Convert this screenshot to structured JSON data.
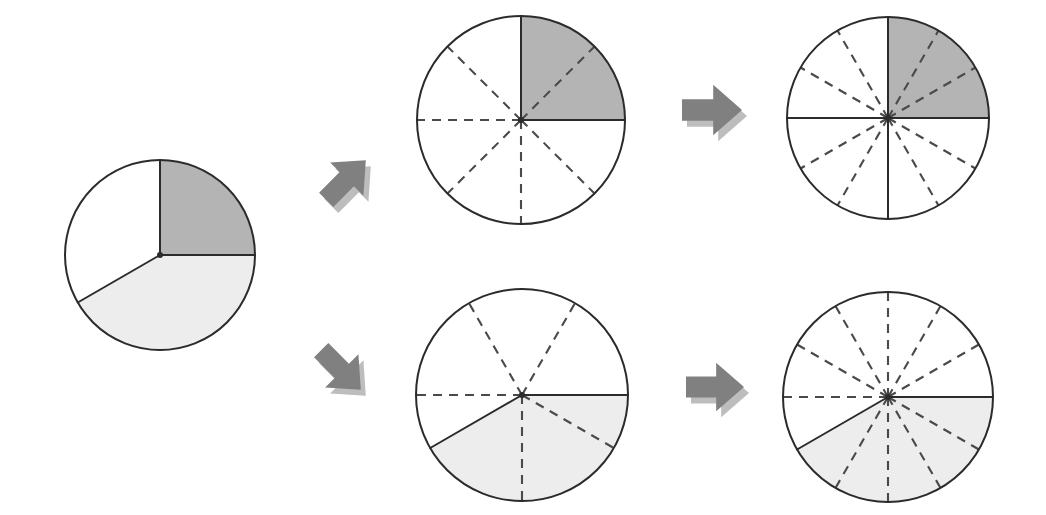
{
  "figure": {
    "background_color": "#ffffff",
    "stroke_color": "#2b2b2b",
    "dash_color": "#4a4a4a",
    "arrow_fill": "#808080",
    "arrow_shadow": "#bdbdbd",
    "shade_dark": "#b4b4b4",
    "shade_light": "#ededed",
    "shade_white": "#ffffff"
  },
  "chart_data": [
    {
      "type": "pie",
      "name": "source-pie-thirds",
      "label": "1 whole divided into thirds",
      "center": [
        160,
        255
      ],
      "radius": 95,
      "divisions": 3,
      "categories": [
        "dark-third",
        "light-third",
        "white-third"
      ],
      "values": [
        1,
        1,
        1
      ],
      "fractions": [
        "1/3",
        "1/3",
        "1/3"
      ],
      "colors": [
        "#b4b4b4",
        "#ededed",
        "#ffffff"
      ],
      "sector_bounds_deg": [
        [
          0,
          90
        ],
        [
          210,
          360
        ],
        [
          90,
          210
        ]
      ],
      "solid_radii_deg": [
        0,
        90,
        210
      ],
      "dashed_radii_deg": []
    },
    {
      "type": "pie",
      "name": "top-pie-eighths",
      "label": "thirds re-partitioned into eighths, 2/8 shaded dark",
      "center": [
        521,
        120
      ],
      "radius": 104,
      "divisions": 8,
      "categories": [
        "shaded",
        "unshaded"
      ],
      "values": [
        2,
        6
      ],
      "fractions": [
        "2/8",
        "6/8"
      ],
      "colors": [
        "#b4b4b4",
        "#ffffff"
      ],
      "sector_bounds_deg": [
        [
          0,
          90
        ],
        [
          90,
          360
        ]
      ],
      "solid_radii_deg": [
        0,
        90
      ],
      "dashed_radii_deg": [
        45,
        135,
        180,
        225,
        270,
        315
      ]
    },
    {
      "type": "pie",
      "name": "top-pie-twelfths",
      "label": "twelfths, 3/12 shaded dark",
      "center": [
        888,
        118
      ],
      "radius": 101,
      "divisions": 12,
      "categories": [
        "shaded",
        "unshaded"
      ],
      "values": [
        3,
        9
      ],
      "fractions": [
        "3/12",
        "9/12"
      ],
      "colors": [
        "#b4b4b4",
        "#ffffff"
      ],
      "sector_bounds_deg": [
        [
          0,
          90
        ],
        [
          90,
          360
        ]
      ],
      "solid_radii_deg": [
        0,
        90,
        180,
        270
      ],
      "dashed_radii_deg": [
        30,
        60,
        120,
        150,
        210,
        240,
        300,
        330
      ]
    },
    {
      "type": "pie",
      "name": "bottom-pie-sixths",
      "label": "sixths, 2/6 shaded light",
      "center": [
        522,
        395
      ],
      "radius": 106,
      "divisions": 6,
      "categories": [
        "shaded",
        "unshaded"
      ],
      "values": [
        2,
        4
      ],
      "fractions": [
        "2/6",
        "4/6"
      ],
      "colors": [
        "#ededed",
        "#ffffff"
      ],
      "sector_bounds_deg": [
        [
          210,
          360
        ],
        [
          0,
          210
        ]
      ],
      "solid_radii_deg": [
        0,
        210
      ],
      "dashed_radii_deg": [
        60,
        120,
        180,
        270,
        330
      ]
    },
    {
      "type": "pie",
      "name": "bottom-pie-twelfths",
      "label": "twelfths, 5/12 shaded light",
      "center": [
        888,
        397
      ],
      "radius": 105,
      "divisions": 12,
      "categories": [
        "shaded",
        "unshaded"
      ],
      "values": [
        5,
        7
      ],
      "fractions": [
        "5/12",
        "7/12"
      ],
      "colors": [
        "#ededed",
        "#ffffff"
      ],
      "sector_bounds_deg": [
        [
          210,
          360
        ],
        [
          0,
          210
        ]
      ],
      "solid_radii_deg": [
        0,
        210
      ],
      "dashed_radii_deg": [
        30,
        60,
        90,
        120,
        150,
        180,
        240,
        270,
        300,
        330
      ]
    }
  ],
  "arrows": [
    {
      "name": "arrow-up-right",
      "direction": "up-right",
      "position": [
        318,
        152
      ],
      "size": 56,
      "fill": "#808080"
    },
    {
      "name": "arrow-right-top",
      "direction": "right",
      "position": [
        682,
        80
      ],
      "size": 60,
      "fill": "#808080"
    },
    {
      "name": "arrow-down-right",
      "direction": "down-right",
      "position": [
        313,
        342
      ],
      "size": 56,
      "fill": "#808080"
    },
    {
      "name": "arrow-right-bottom",
      "direction": "right",
      "position": [
        686,
        358
      ],
      "size": 58,
      "fill": "#808080"
    }
  ]
}
